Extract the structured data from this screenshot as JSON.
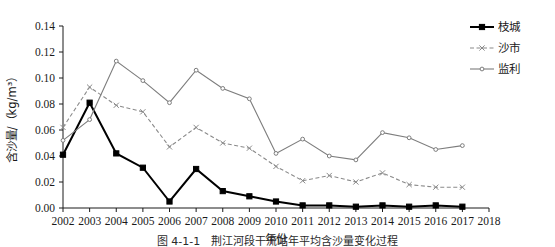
{
  "chart_data": {
    "type": "line",
    "title": "",
    "xlabel": "年份",
    "ylabel": "含沙量/（kg/m³）",
    "x": [
      2002,
      2003,
      2004,
      2005,
      2006,
      2007,
      2008,
      2009,
      2010,
      2011,
      2012,
      2013,
      2014,
      2015,
      2016,
      2017
    ],
    "xlim": [
      2002,
      2018
    ],
    "ylim": [
      0.0,
      0.14
    ],
    "xticks": [
      "2002",
      "2003",
      "2004",
      "2005",
      "2006",
      "2007",
      "2008",
      "2009",
      "2010",
      "2011",
      "2012",
      "2013",
      "2014",
      "2015",
      "2016",
      "2017",
      "2018"
    ],
    "yticks": [
      "0.00",
      "0.02",
      "0.04",
      "0.06",
      "0.08",
      "0.10",
      "0.12",
      "0.14"
    ],
    "grid": false,
    "legend_position": "top-right",
    "series": [
      {
        "name": "枝城",
        "color": "#000000",
        "style": "solid",
        "marker": "square-filled",
        "values": [
          0.041,
          0.081,
          0.042,
          0.031,
          0.005,
          0.03,
          0.013,
          0.009,
          0.005,
          0.002,
          0.002,
          0.001,
          0.002,
          0.001,
          0.002,
          0.001
        ]
      },
      {
        "name": "沙市",
        "color": "#8a8a8a",
        "style": "dashed",
        "marker": "x",
        "values": [
          0.062,
          0.093,
          0.079,
          0.074,
          0.047,
          0.062,
          0.05,
          0.046,
          0.032,
          0.021,
          0.025,
          0.02,
          0.027,
          0.018,
          0.016,
          0.016
        ]
      },
      {
        "name": "监利",
        "color": "#7d7d7d",
        "style": "solid",
        "marker": "dot",
        "values": [
          0.052,
          0.068,
          0.113,
          0.098,
          0.081,
          0.106,
          0.092,
          0.084,
          0.042,
          0.053,
          0.04,
          0.037,
          0.058,
          0.054,
          0.045,
          0.048
        ]
      }
    ]
  },
  "caption": {
    "text": "图 4-1-1　荆江河段干流站年平均含沙量变化过程"
  }
}
